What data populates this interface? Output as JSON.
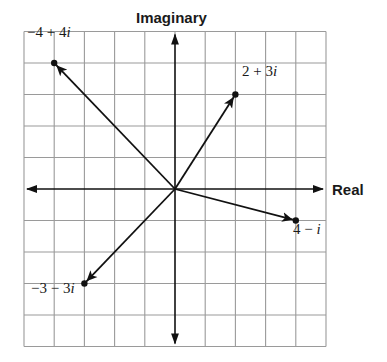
{
  "diagram": {
    "title_vertical_axis": "Imaginary",
    "title_horizontal_axis": "Real",
    "grid": {
      "x_min": -5,
      "x_max": 5,
      "y_min": -5,
      "y_max": 5,
      "origin_px": [
        175,
        189
      ],
      "cell_w": 30.2,
      "cell_h": 31.5,
      "line_color": "#9a9a9a",
      "axis_color": "#111111"
    },
    "vectors": [
      {
        "re": -4,
        "im": 4,
        "label": "−4 + 4",
        "suffix": "i",
        "label_pos": [
          27,
          39
        ]
      },
      {
        "re": 2,
        "im": 3,
        "label": "2 + 3",
        "suffix": "i",
        "label_pos": [
          242,
          78
        ]
      },
      {
        "re": 4,
        "im": -1,
        "label": "4 − ",
        "suffix": "i",
        "label_pos": [
          293,
          236
        ]
      },
      {
        "re": -3,
        "im": -3,
        "label": "−3 − 3",
        "suffix": "i",
        "label_pos": [
          31,
          295
        ]
      }
    ]
  }
}
